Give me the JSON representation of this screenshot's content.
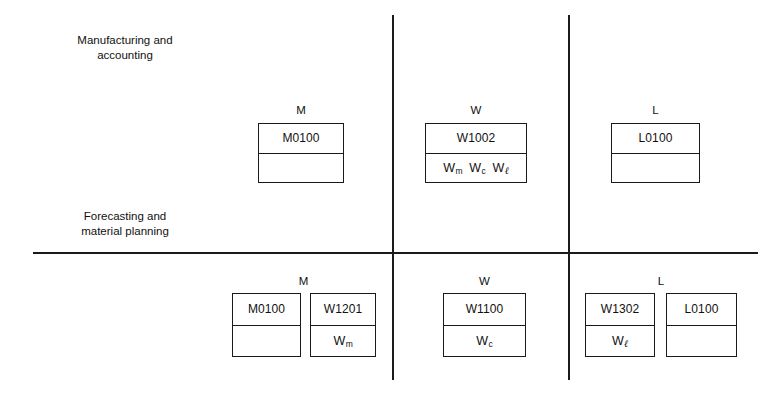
{
  "diagram": {
    "line_color": "#1a1a1a",
    "background": "#ffffff"
  },
  "sections": [
    {
      "id": "manufacturing",
      "caption": "Manufacturing and\naccounting",
      "columns": [
        {
          "id": "top-m",
          "header": "M",
          "boxes": [
            {
              "id": "top-m-m0100",
              "top": "M0100",
              "bottom": "",
              "bottom_symbols": []
            }
          ]
        },
        {
          "id": "top-w",
          "header": "W",
          "boxes": [
            {
              "id": "top-w-w1002",
              "top": "W1002",
              "bottom": "W_m W_c W_l",
              "bottom_symbols": [
                {
                  "base": "W",
                  "sub": "m",
                  "script": false
                },
                {
                  "base": "W",
                  "sub": "c",
                  "script": false
                },
                {
                  "base": "W",
                  "sub": "ℓ",
                  "script": true
                }
              ]
            }
          ]
        },
        {
          "id": "top-l",
          "header": "L",
          "boxes": [
            {
              "id": "top-l-l0100",
              "top": "L0100",
              "bottom": "",
              "bottom_symbols": []
            }
          ]
        }
      ]
    },
    {
      "id": "forecasting",
      "caption": "Forecasting and\nmaterial planning",
      "columns": [
        {
          "id": "bot-m",
          "header": "M",
          "boxes": [
            {
              "id": "bot-m-m0100",
              "top": "M0100",
              "bottom": "",
              "bottom_symbols": []
            },
            {
              "id": "bot-m-w1201",
              "top": "W1201",
              "bottom": "W_m",
              "bottom_symbols": [
                {
                  "base": "W",
                  "sub": "m",
                  "script": false
                }
              ]
            }
          ]
        },
        {
          "id": "bot-w",
          "header": "W",
          "boxes": [
            {
              "id": "bot-w-w1100",
              "top": "W1100",
              "bottom": "W_c",
              "bottom_symbols": [
                {
                  "base": "W",
                  "sub": "c",
                  "script": false
                }
              ]
            }
          ]
        },
        {
          "id": "bot-l",
          "header": "L",
          "boxes": [
            {
              "id": "bot-l-w1302",
              "top": "W1302",
              "bottom": "W_l",
              "bottom_symbols": [
                {
                  "base": "W",
                  "sub": "ℓ",
                  "script": true
                }
              ]
            },
            {
              "id": "bot-l-l0100",
              "top": "L0100",
              "bottom": "",
              "bottom_symbols": []
            }
          ]
        }
      ]
    }
  ]
}
